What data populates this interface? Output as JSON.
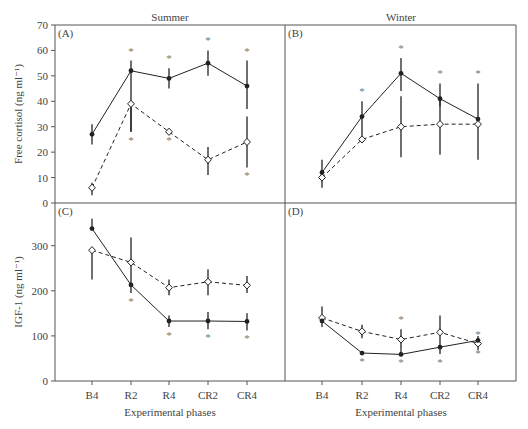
{
  "chart_data": [
    {
      "panel": "A",
      "type": "line",
      "column_title": "Summer",
      "ylabel": "Free cortisol (ng ml⁻¹)",
      "xlabel": "",
      "ylim": [
        0,
        70
      ],
      "yticks": [
        0,
        10,
        20,
        30,
        40,
        50,
        60,
        70
      ],
      "categories": [
        "B4",
        "R2",
        "R4",
        "CR2",
        "CR4"
      ],
      "series": [
        {
          "name": "filled",
          "marker": "filled-circle",
          "line": "solid",
          "values": [
            27,
            52,
            49,
            55,
            46
          ],
          "err_low": [
            23,
            28,
            45,
            50,
            37
          ],
          "err_high": [
            31,
            56,
            53,
            60,
            56
          ],
          "sig": [
            false,
            true,
            true,
            true,
            true
          ],
          "sig_pos": "above"
        },
        {
          "name": "open",
          "marker": "open-diamond",
          "line": "dashed",
          "values": [
            6,
            39,
            28,
            17,
            24
          ],
          "err_low": [
            3,
            28,
            28,
            11,
            14
          ],
          "err_high": [
            8,
            39,
            28,
            22,
            34
          ],
          "sig": [
            false,
            true,
            true,
            false,
            true
          ],
          "sig_pos": "below"
        }
      ]
    },
    {
      "panel": "B",
      "type": "line",
      "column_title": "Winter",
      "ylabel": "",
      "xlabel": "",
      "ylim": [
        0,
        70
      ],
      "categories": [
        "B4",
        "R2",
        "R4",
        "CR2",
        "CR4"
      ],
      "series": [
        {
          "name": "filled",
          "marker": "filled-circle",
          "line": "solid",
          "values": [
            12,
            34,
            51,
            41,
            33
          ],
          "err_low": [
            10,
            25,
            44,
            38,
            30
          ],
          "err_high": [
            17,
            40,
            57,
            47,
            47
          ],
          "sig": [
            false,
            true,
            true,
            true,
            true
          ],
          "sig_pos": "above"
        },
        {
          "name": "open",
          "marker": "open-diamond",
          "line": "dashed",
          "values": [
            10,
            25,
            30,
            31,
            31
          ],
          "err_low": [
            6,
            25,
            18,
            19,
            17
          ],
          "err_high": [
            10,
            25,
            42,
            41,
            31
          ],
          "sig": [
            false,
            false,
            false,
            false,
            false
          ],
          "sig_pos": "below"
        }
      ]
    },
    {
      "panel": "C",
      "type": "line",
      "ylabel": "IGF-1 (ng ml⁻¹)",
      "xlabel": "Experimental phases",
      "ylim": [
        0,
        390
      ],
      "yticks": [
        0,
        100,
        200,
        300
      ],
      "categories": [
        "B4",
        "R2",
        "R4",
        "CR2",
        "CR4"
      ],
      "series": [
        {
          "name": "filled",
          "marker": "filled-circle",
          "line": "solid",
          "values": [
            338,
            213,
            133,
            133,
            132
          ],
          "err_low": [
            338,
            195,
            120,
            115,
            112
          ],
          "err_high": [
            360,
            213,
            145,
            153,
            150
          ],
          "sig": [
            false,
            true,
            true,
            true,
            true
          ],
          "sig_pos": "below"
        },
        {
          "name": "open",
          "marker": "open-diamond",
          "line": "dashed",
          "values": [
            290,
            263,
            207,
            220,
            212
          ],
          "err_low": [
            225,
            213,
            190,
            190,
            195
          ],
          "err_high": [
            290,
            318,
            225,
            248,
            233
          ],
          "sig": [
            false,
            false,
            false,
            false,
            false
          ],
          "sig_pos": "above"
        }
      ]
    },
    {
      "panel": "D",
      "type": "line",
      "ylabel": "",
      "xlabel": "Experimental phases",
      "ylim": [
        0,
        390
      ],
      "categories": [
        "B4",
        "R2",
        "R4",
        "CR2",
        "CR4"
      ],
      "series": [
        {
          "name": "filled",
          "marker": "filled-circle",
          "line": "solid",
          "values": [
            133,
            62,
            59,
            75,
            90
          ],
          "err_low": [
            120,
            62,
            59,
            60,
            80
          ],
          "err_high": [
            133,
            62,
            70,
            75,
            100
          ],
          "sig": [
            false,
            true,
            true,
            true,
            true
          ],
          "sig_pos": "below"
        },
        {
          "name": "open",
          "marker": "open-diamond",
          "line": "dashed",
          "values": [
            140,
            110,
            92,
            108,
            83
          ],
          "err_low": [
            140,
            95,
            70,
            80,
            68
          ],
          "err_high": [
            165,
            125,
            115,
            145,
            83
          ],
          "sig": [
            false,
            false,
            true,
            false,
            true
          ],
          "sig_pos": "above"
        }
      ]
    }
  ],
  "labels": {
    "summer": "Summer",
    "winter": "Winter",
    "panelA": "(A)",
    "panelB": "(B)",
    "panelC": "(C)",
    "panelD": "(D)",
    "ylabel_top": "Free cortisol (ng ml⁻¹)",
    "ylabel_bottom": "IGF-1 (ng ml⁻¹)",
    "xlabel": "Experimental phases",
    "categories": [
      "B4",
      "R2",
      "R4",
      "CR2",
      "CR4"
    ],
    "yticks_top": [
      "0",
      "10",
      "20",
      "30",
      "40",
      "50",
      "60",
      "70"
    ],
    "yticks_bottom": [
      "0",
      "100",
      "200",
      "300"
    ]
  },
  "colors": {
    "line": "#222222",
    "axis": "#555555",
    "asterisk": "#777777",
    "text": "#444444"
  }
}
